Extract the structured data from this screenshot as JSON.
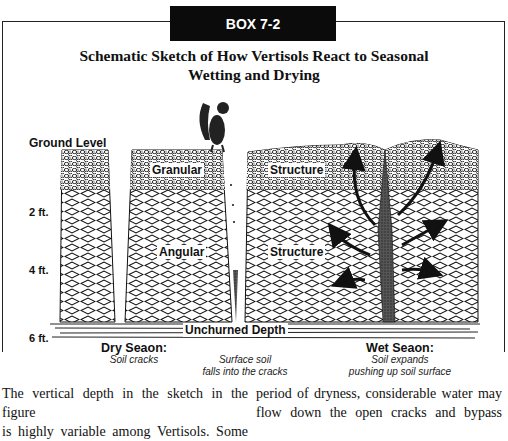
{
  "box": {
    "label": "BOX 7-2",
    "title_line1": "Schematic Sketch of How Vertisols React to Seasonal",
    "title_line2": "Wetting and Drying"
  },
  "figure": {
    "depth_labels": {
      "ground": "Ground Level",
      "two_ft": "2 ft.",
      "four_ft": "4 ft.",
      "six_ft": "6 ft."
    },
    "layer_tags": {
      "granular": "Granular",
      "structure_top": "Structure",
      "angular": "Angular",
      "structure_mid": "Structure",
      "unchurned": "Unchurned Depth"
    },
    "captions": {
      "dry_head": "Dry Seaon:",
      "dry_sub": "Soil cracks",
      "middle_line1": "Surface soil",
      "middle_line2": "falls into the cracks",
      "wet_head": "Wet Seaon:",
      "wet_line1": "Soil expands",
      "wet_line2": "pushing up soil surface"
    }
  },
  "body_text": {
    "left_line1": "The vertical depth in the sketch in the figure",
    "left_line2": "is highly variable among Vertisols. Some",
    "right_line1": "period of dryness, considerable water may",
    "right_line2": "flow down the open cracks and bypass"
  }
}
